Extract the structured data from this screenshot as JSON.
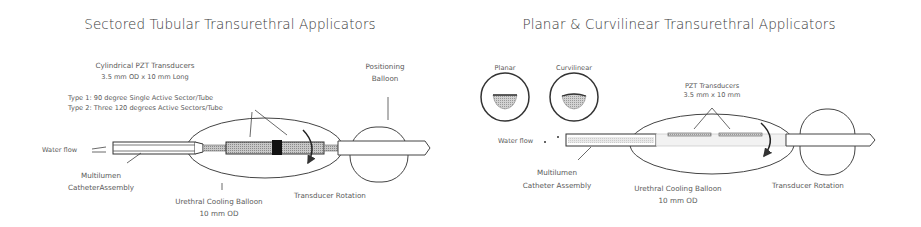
{
  "left_panel": {
    "title": "Sectored Tubular Transurethral Applicators",
    "transducer_label_line1": "Cylindrical PZT Transducers",
    "transducer_label_line2": "3.5 mm OD x 10 mm Long",
    "type1": "Type 1: 90 degree Single Active Sector/Tube",
    "type2": "Type 2: Three 120 degrees Active Sectors/Tube",
    "positioning_balloon_line1": "Positioning",
    "positioning_balloon_line2": "Balloon",
    "water_flow": "Water flow",
    "catheter_line1": "Multilumen",
    "catheter_line2": "CatheterAssembly",
    "cooling_balloon_line1": "Urethral Cooling Balloon",
    "cooling_balloon_line2": "10 mm OD",
    "rotation": "Transducer Rotation"
  },
  "right_panel": {
    "title": "Planar & Curvilinear Transurethral Applicators",
    "planar": "Planar",
    "curvilinear": "Curvilinear",
    "transducer_label_line1": "PZT Transducers",
    "transducer_label_line2": "3.5 mm x 10 mm",
    "water_flow": "Water flow",
    "catheter_line1": "Multilumen",
    "catheter_line2": "Catheter Assembly",
    "cooling_balloon_line1": "Urethral Cooling Balloon",
    "cooling_balloon_line2": "10 mm OD",
    "rotation": "Transducer Rotation"
  },
  "colors": {
    "line": "#3c3c3c",
    "hatch": "#9a9a9a",
    "text": "#5a5a5a"
  }
}
